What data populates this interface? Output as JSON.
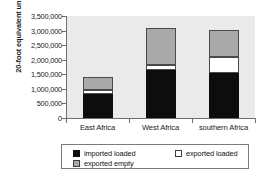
{
  "chart_data": {
    "type": "bar",
    "title": "",
    "subtitle": "",
    "xlabel": "",
    "ylabel": "20-foot equivalent units",
    "categories": [
      "East Africa",
      "West Africa",
      "southern Africa"
    ],
    "stacked": true,
    "grid": false,
    "legend_position": "bottom",
    "ylim": [
      0,
      3500000
    ],
    "ytick_values": [
      0,
      500000,
      1000000,
      1500000,
      2000000,
      2500000,
      3000000,
      3500000
    ],
    "ytick_labels": [
      "0",
      "500,000",
      "1,000,000",
      "1,500,000",
      "2,000,000",
      "2,500,000",
      "3,000,000",
      "3,500,000"
    ],
    "series": [
      {
        "name": "imported loaded",
        "color": "#0d0d0d",
        "values": [
          825000,
          1650000,
          1550000
        ]
      },
      {
        "name": "exported loaded",
        "color": "#ffffff",
        "values": [
          140000,
          170000,
          550000
        ]
      },
      {
        "name": "exported empty",
        "color": "#a9a9a9",
        "values": [
          450000,
          1280000,
          930000
        ]
      }
    ],
    "totals": [
      1415000,
      3100000,
      3030000
    ]
  },
  "legend": {
    "items": [
      {
        "label": "imported loaded"
      },
      {
        "label": "exported loaded"
      },
      {
        "label": "exported empty"
      }
    ]
  }
}
